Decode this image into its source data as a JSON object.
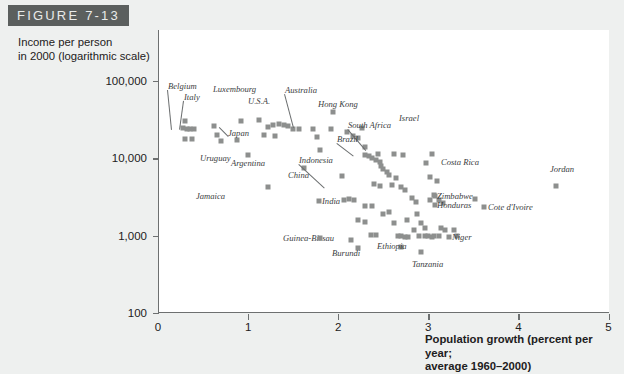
{
  "figure": {
    "banner_label": "FIGURE 7-13",
    "banner_color": "#5b5f5e"
  },
  "chart_data": {
    "type": "scatter",
    "title": "FIGURE 7-13",
    "ylabel": "Income per person in 2000 (logarithmic scale)",
    "xlabel": "Population growth (percent per year; average 1960–2000)",
    "grid": false,
    "legend": "none",
    "marker_color": "#8d8f8e",
    "xlim": [
      0,
      5.15
    ],
    "ylim": [
      100,
      150000
    ],
    "yscale": "log",
    "xticks": [
      0,
      1,
      2,
      3,
      4,
      5
    ],
    "xtick_labels": [
      "0",
      "1",
      "2",
      "3",
      "4",
      "5"
    ],
    "yticks": [
      100,
      1000,
      10000,
      100000
    ],
    "ytick_labels": [
      "100",
      "1,000",
      "10,000",
      "100,000"
    ],
    "points": [
      [
        0.28,
        24500
      ],
      [
        0.32,
        24000
      ],
      [
        0.36,
        24200
      ],
      [
        0.4,
        24000
      ],
      [
        0.3,
        17800
      ],
      [
        0.38,
        17600
      ],
      [
        0.3,
        30500
      ],
      [
        0.62,
        26500
      ],
      [
        0.66,
        20200
      ],
      [
        0.7,
        16800
      ],
      [
        0.88,
        17500
      ],
      [
        0.92,
        30000
      ],
      [
        1.0,
        11200
      ],
      [
        1.12,
        31000
      ],
      [
        1.22,
        25600
      ],
      [
        1.28,
        26800
      ],
      [
        1.34,
        27600
      ],
      [
        1.4,
        27000
      ],
      [
        1.44,
        26000
      ],
      [
        1.5,
        24200
      ],
      [
        1.56,
        24000
      ],
      [
        1.3,
        19600
      ],
      [
        1.18,
        20200
      ],
      [
        1.22,
        4200
      ],
      [
        1.62,
        7400
      ],
      [
        1.72,
        23600
      ],
      [
        1.76,
        18800
      ],
      [
        1.8,
        12700
      ],
      [
        1.92,
        24200
      ],
      [
        1.94,
        40000
      ],
      [
        2.04,
        5900
      ],
      [
        2.1,
        22200
      ],
      [
        2.16,
        19500
      ],
      [
        2.22,
        18200
      ],
      [
        2.26,
        24400
      ],
      [
        2.3,
        14200
      ],
      [
        2.12,
        3000
      ],
      [
        2.06,
        2850
      ],
      [
        2.18,
        2900
      ],
      [
        2.3,
        2420
      ],
      [
        2.38,
        2400
      ],
      [
        2.3,
        11200
      ],
      [
        2.34,
        10800
      ],
      [
        2.38,
        10200
      ],
      [
        2.42,
        9600
      ],
      [
        2.46,
        9000
      ],
      [
        2.48,
        8000
      ],
      [
        2.5,
        7200
      ],
      [
        2.54,
        6600
      ],
      [
        2.56,
        6000
      ],
      [
        2.44,
        11400
      ],
      [
        2.4,
        4700
      ],
      [
        2.46,
        4400
      ],
      [
        2.6,
        4500
      ],
      [
        2.62,
        11500
      ],
      [
        2.72,
        11200
      ],
      [
        2.64,
        5500
      ],
      [
        2.7,
        4200
      ],
      [
        2.74,
        3900
      ],
      [
        2.22,
        1600
      ],
      [
        2.3,
        1500
      ],
      [
        2.36,
        1020
      ],
      [
        2.42,
        1010
      ],
      [
        2.14,
        870
      ],
      [
        2.22,
        700
      ],
      [
        2.5,
        1900
      ],
      [
        2.56,
        2000
      ],
      [
        2.62,
        1450
      ],
      [
        2.66,
        1000
      ],
      [
        2.7,
        980
      ],
      [
        2.74,
        970
      ],
      [
        2.78,
        960
      ],
      [
        2.7,
        720
      ],
      [
        2.76,
        1600
      ],
      [
        2.82,
        3100
      ],
      [
        2.86,
        2700
      ],
      [
        2.88,
        1900
      ],
      [
        2.92,
        1450
      ],
      [
        2.96,
        1250
      ],
      [
        2.84,
        1200
      ],
      [
        2.9,
        1000
      ],
      [
        2.96,
        990
      ],
      [
        3.0,
        980
      ],
      [
        3.04,
        960
      ],
      [
        2.92,
        620
      ],
      [
        3.02,
        2900
      ],
      [
        3.06,
        3400
      ],
      [
        3.1,
        5100
      ],
      [
        3.12,
        2900
      ],
      [
        3.16,
        2650
      ],
      [
        3.14,
        1250
      ],
      [
        3.18,
        1200
      ],
      [
        3.06,
        1000
      ],
      [
        3.12,
        990
      ],
      [
        2.98,
        8600
      ],
      [
        3.02,
        5800
      ],
      [
        3.04,
        11500
      ],
      [
        3.28,
        1200
      ],
      [
        3.32,
        1000
      ],
      [
        4.42,
        4400
      ],
      [
        3.52,
        3000
      ]
    ],
    "annotations": [
      {
        "label": "Belgium",
        "lx": 168,
        "ly": 86,
        "px": 172,
        "py": 126,
        "align": "left",
        "leader": true
      },
      {
        "label": "Italy",
        "lx": 184,
        "ly": 97,
        "px": 180,
        "py": 126,
        "align": "left",
        "leader": true
      },
      {
        "label": "Luxembourg",
        "lx": 213,
        "ly": 89,
        "px": null,
        "py": null,
        "align": "left",
        "leader": false
      },
      {
        "label": "Australia",
        "lx": 285,
        "ly": 90,
        "px": 294,
        "py": 124,
        "align": "left",
        "leader": true
      },
      {
        "label": "U.S.A.",
        "lx": 248,
        "ly": 101,
        "px": null,
        "py": null,
        "align": "left",
        "leader": false
      },
      {
        "label": "Hong Kong",
        "lx": 318,
        "ly": 104,
        "px": null,
        "py": null,
        "align": "left",
        "leader": false
      },
      {
        "label": "Israel",
        "lx": 399,
        "ly": 118,
        "px": null,
        "py": null,
        "align": "left",
        "leader": false
      },
      {
        "label": "South Africa",
        "lx": 348,
        "ly": 125,
        "px": 366,
        "py": 146,
        "align": "left",
        "leader": true
      },
      {
        "label": "Brazil",
        "lx": 337,
        "ly": 139,
        "px": 354,
        "py": 152,
        "align": "left",
        "leader": true
      },
      {
        "label": "Japan",
        "lx": 228,
        "ly": 133,
        "px": 219,
        "py": 124,
        "align": "left",
        "leader": true
      },
      {
        "label": "Uruguay",
        "lx": 200,
        "ly": 158,
        "px": null,
        "py": null,
        "align": "left",
        "leader": false
      },
      {
        "label": "Argentina",
        "lx": 231,
        "ly": 163,
        "px": null,
        "py": null,
        "align": "left",
        "leader": false
      },
      {
        "label": "Indonesia",
        "lx": 299,
        "ly": 160,
        "px": 325,
        "py": 184,
        "align": "left",
        "leader": true
      },
      {
        "label": "China",
        "lx": 288,
        "ly": 175,
        "px": null,
        "py": null,
        "align": "left",
        "leader": false
      },
      {
        "label": "Costa Rica",
        "lx": 441,
        "ly": 162,
        "px": null,
        "py": null,
        "align": "left",
        "leader": false
      },
      {
        "label": "Jordan",
        "lx": 550,
        "ly": 169,
        "px": null,
        "py": null,
        "align": "left",
        "leader": false
      },
      {
        "label": "Jamaica",
        "lx": 196,
        "ly": 196,
        "px": null,
        "py": null,
        "align": "left",
        "leader": false
      },
      {
        "label": "India",
        "lx": 322,
        "ly": 201,
        "px": null,
        "py": null,
        "align": "left",
        "leader": false
      },
      {
        "label": "Zimbabwe",
        "lx": 437,
        "ly": 196,
        "px": null,
        "py": null,
        "align": "left",
        "leader": false
      },
      {
        "label": "Honduras",
        "lx": 437,
        "ly": 205,
        "px": null,
        "py": null,
        "align": "left",
        "leader": false
      },
      {
        "label": "Cote d'Ivoire",
        "lx": 488,
        "ly": 207,
        "px": null,
        "py": null,
        "align": "left",
        "leader": false
      },
      {
        "label": "Niger",
        "lx": 452,
        "ly": 237,
        "px": null,
        "py": null,
        "align": "left",
        "leader": false
      },
      {
        "label": "Guinea-Bissau",
        "lx": 283,
        "ly": 238,
        "px": null,
        "py": null,
        "align": "left",
        "leader": false
      },
      {
        "label": "Burundi",
        "lx": 332,
        "ly": 253,
        "px": null,
        "py": null,
        "align": "left",
        "leader": false
      },
      {
        "label": "Ethiopia",
        "lx": 377,
        "ly": 246,
        "px": null,
        "py": null,
        "align": "left",
        "leader": false
      },
      {
        "label": "Tanzania",
        "lx": 412,
        "ly": 264,
        "px": null,
        "py": null,
        "align": "left",
        "leader": false
      }
    ],
    "label_swatches": [
      {
        "x": 435,
        "y": 196
      },
      {
        "x": 435,
        "y": 205
      },
      {
        "x": 484,
        "y": 207
      },
      {
        "x": 449,
        "y": 237
      },
      {
        "x": 320,
        "y": 238
      },
      {
        "x": 319,
        "y": 201
      }
    ]
  },
  "ylabel_lines": [
    "Income per person",
    "in 2000 (logarithmic scale)"
  ],
  "xlabel_lines": [
    "Population growth (percent per year;",
    "average 1960–2000)"
  ]
}
